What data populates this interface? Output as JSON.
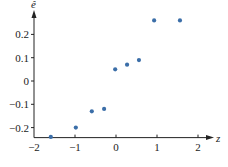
{
  "chart_data": {
    "type": "scatter",
    "title": "",
    "xlabel": "z",
    "ylabel": "ê",
    "xlim": [
      -2,
      2.3
    ],
    "ylim": [
      -0.243,
      0.3
    ],
    "x_ticks": [
      -2,
      -1,
      0,
      1,
      2
    ],
    "x_tick_labels": [
      "−2",
      "−1",
      "0",
      "1",
      "2"
    ],
    "y_ticks": [
      -0.2,
      -0.1,
      0,
      0.1,
      0.2
    ],
    "y_tick_labels": [
      "−0.2",
      "−0.1",
      "0",
      "0.1",
      "0.2"
    ],
    "grid": false,
    "legend": null,
    "marker_color": "#3b6ea8",
    "axis_color": "#222222",
    "series": [
      {
        "name": "residuals",
        "points": [
          {
            "x": -1.59,
            "y": -0.24
          },
          {
            "x": -0.98,
            "y": -0.2
          },
          {
            "x": -0.59,
            "y": -0.13
          },
          {
            "x": -0.29,
            "y": -0.12
          },
          {
            "x": -0.02,
            "y": 0.05
          },
          {
            "x": 0.27,
            "y": 0.07
          },
          {
            "x": 0.56,
            "y": 0.09
          },
          {
            "x": 0.93,
            "y": 0.26
          },
          {
            "x": 1.56,
            "y": 0.26
          }
        ]
      }
    ]
  }
}
